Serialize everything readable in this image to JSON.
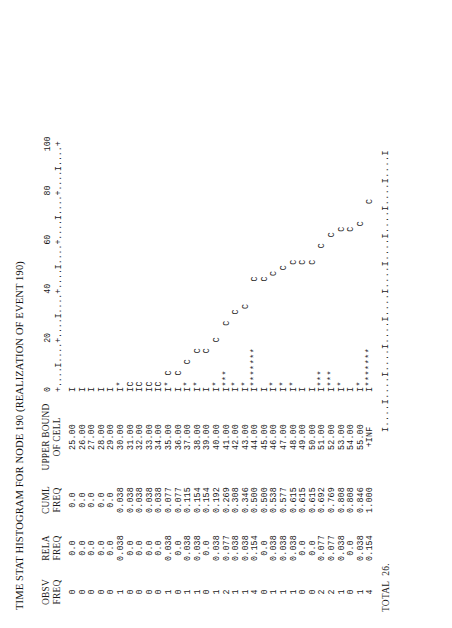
{
  "report": {
    "title": "TIME STAT HISTOGRAM FOR NODE 190 (REALIZATION OF EVENT 190)",
    "total_label": "TOTAL  26."
  },
  "columns": {
    "obsv": {
      "line1": "OBSV",
      "line2": "FREQ"
    },
    "rela": {
      "line1": "RELA",
      "line2": "FREQ"
    },
    "cuml": {
      "line1": "CUML",
      "line2": "FREQ"
    },
    "bound": {
      "line1": "UPPER BOUND",
      "line2": "OF CELL"
    }
  },
  "axis": {
    "tick_numbers": "0         20        40        60        80       100",
    "ruler": "+....I....+....I....+....I....+....I....+....I....+",
    "ruler_foot": "I....I....I....I....I....I....I....I....I....I....I",
    "labels": [
      "0",
      "20",
      "40",
      "60",
      "80",
      "100"
    ],
    "min": 0,
    "max": 100
  },
  "chart_data": {
    "type": "bar",
    "title": "TIME STAT HISTOGRAM FOR NODE 190 (REALIZATION OF EVENT 190)",
    "xlabel": "PERCENTAGE",
    "ylabel": "UPPER BOUND OF CELL",
    "xlim": [
      0,
      100
    ],
    "grid": false,
    "legend": [
      "* = relative frequency",
      "C = cumulative frequency"
    ],
    "total_observations": 26,
    "categories": [
      "25.00",
      "26.00",
      "27.00",
      "28.00",
      "29.00",
      "30.00",
      "31.00",
      "32.00",
      "33.00",
      "34.00",
      "35.00",
      "36.00",
      "37.00",
      "38.00",
      "39.00",
      "40.00",
      "41.00",
      "42.00",
      "43.00",
      "44.00",
      "45.00",
      "46.00",
      "47.00",
      "48.00",
      "49.00",
      "50.00",
      "51.00",
      "52.00",
      "53.00",
      "54.00",
      "55.00",
      "+INF"
    ],
    "series": [
      {
        "name": "OBSV FREQ",
        "values": [
          0,
          0,
          0,
          0,
          0,
          1,
          0,
          0,
          0,
          0,
          1,
          0,
          1,
          1,
          0,
          1,
          2,
          1,
          1,
          4,
          0,
          1,
          1,
          1,
          0,
          0,
          2,
          2,
          1,
          0,
          1,
          4
        ]
      },
      {
        "name": "RELA FREQ",
        "values": [
          0.0,
          0.0,
          0.0,
          0.0,
          0.0,
          0.038,
          0.0,
          0.0,
          0.0,
          0.0,
          0.038,
          0.0,
          0.038,
          0.038,
          0.0,
          0.038,
          0.077,
          0.038,
          0.038,
          0.154,
          0.0,
          0.038,
          0.038,
          0.038,
          0.0,
          0.0,
          0.077,
          0.077,
          0.038,
          0.0,
          0.038,
          0.154
        ]
      },
      {
        "name": "CUML FREQ",
        "values": [
          0.0,
          0.0,
          0.0,
          0.0,
          0.0,
          0.038,
          0.038,
          0.038,
          0.038,
          0.038,
          0.077,
          0.077,
          0.115,
          0.154,
          0.154,
          0.192,
          0.269,
          0.308,
          0.346,
          0.5,
          0.5,
          0.538,
          0.577,
          0.615,
          0.615,
          0.615,
          0.692,
          0.769,
          0.808,
          0.808,
          0.846,
          1.0
        ]
      }
    ]
  },
  "rows": [
    {
      "obsv": "0",
      "rela": "0.0",
      "cuml": "0.0",
      "bound": "25.00",
      "plot": "I"
    },
    {
      "obsv": "0",
      "rela": "0.0",
      "cuml": "0.0",
      "bound": "26.00",
      "plot": "I"
    },
    {
      "obsv": "0",
      "rela": "0.0",
      "cuml": "0.0",
      "bound": "27.00",
      "plot": "I"
    },
    {
      "obsv": "0",
      "rela": "0.0",
      "cuml": "0.0",
      "bound": "28.00",
      "plot": "I"
    },
    {
      "obsv": "0",
      "rela": "0.0",
      "cuml": "0.0",
      "bound": "29.00",
      "plot": "I"
    },
    {
      "obsv": "1",
      "rela": "0.038",
      "cuml": "0.038",
      "bound": "30.00",
      "plot": "I*"
    },
    {
      "obsv": "0",
      "rela": "0.0",
      "cuml": "0.038",
      "bound": "31.00",
      "plot": "IC"
    },
    {
      "obsv": "0",
      "rela": "0.0",
      "cuml": "0.038",
      "bound": "32.00",
      "plot": "IC"
    },
    {
      "obsv": "0",
      "rela": "0.0",
      "cuml": "0.038",
      "bound": "33.00",
      "plot": "IC"
    },
    {
      "obsv": "0",
      "rela": "0.0",
      "cuml": "0.038",
      "bound": "34.00",
      "plot": "IC"
    },
    {
      "obsv": "1",
      "rela": "0.038",
      "cuml": "0.077",
      "bound": "35.00",
      "plot": "I* C"
    },
    {
      "obsv": "0",
      "rela": "0.0",
      "cuml": "0.077",
      "bound": "36.00",
      "plot": "I  C"
    },
    {
      "obsv": "1",
      "rela": "0.038",
      "cuml": "0.115",
      "bound": "37.00",
      "plot": "I*   C"
    },
    {
      "obsv": "1",
      "rela": "0.038",
      "cuml": "0.154",
      "bound": "38.00",
      "plot": "I*     C"
    },
    {
      "obsv": "0",
      "rela": "0.0",
      "cuml": "0.154",
      "bound": "39.00",
      "plot": "I      C"
    },
    {
      "obsv": "1",
      "rela": "0.038",
      "cuml": "0.192",
      "bound": "40.00",
      "plot": "I*       C"
    },
    {
      "obsv": "2",
      "rela": "0.077",
      "cuml": "0.269",
      "bound": "41.00",
      "plot": "I***        C"
    },
    {
      "obsv": "1",
      "rela": "0.038",
      "cuml": "0.308",
      "bound": "42.00",
      "plot": "I*            C"
    },
    {
      "obsv": "1",
      "rela": "0.038",
      "cuml": "0.346",
      "bound": "43.00",
      "plot": "I*             C"
    },
    {
      "obsv": "4",
      "rela": "0.154",
      "cuml": "0.500",
      "bound": "44.00",
      "plot": "I*******            C"
    },
    {
      "obsv": "0",
      "rela": "0.0",
      "cuml": "0.500",
      "bound": "45.00",
      "plot": "I                   C"
    },
    {
      "obsv": "1",
      "rela": "0.038",
      "cuml": "0.538",
      "bound": "46.00",
      "plot": "I*                   C"
    },
    {
      "obsv": "1",
      "rela": "0.038",
      "cuml": "0.577",
      "bound": "47.00",
      "plot": "I*                    C"
    },
    {
      "obsv": "1",
      "rela": "0.038",
      "cuml": "0.615",
      "bound": "48.00",
      "plot": "I*                     C"
    },
    {
      "obsv": "0",
      "rela": "0.0",
      "cuml": "0.615",
      "bound": "49.00",
      "plot": "I                      C"
    },
    {
      "obsv": "0",
      "rela": "0.0",
      "cuml": "0.615",
      "bound": "50.00",
      "plot": "I                      C"
    },
    {
      "obsv": "2",
      "rela": "0.077",
      "cuml": "0.692",
      "bound": "51.00",
      "plot": "I***                      C"
    },
    {
      "obsv": "2",
      "rela": "0.077",
      "cuml": "0.769",
      "bound": "52.00",
      "plot": "I***                        C"
    },
    {
      "obsv": "1",
      "rela": "0.038",
      "cuml": "0.808",
      "bound": "53.00",
      "plot": "I*                           C"
    },
    {
      "obsv": "0",
      "rela": "0.0",
      "cuml": "0.808",
      "bound": "54.00",
      "plot": "I                            C"
    },
    {
      "obsv": "1",
      "rela": "0.038",
      "cuml": "0.846",
      "bound": "55.00",
      "plot": "I*                            C"
    },
    {
      "obsv": "4",
      "rela": "0.154",
      "cuml": "1.000",
      "bound": "+INF",
      "plot": "I*******                          C"
    }
  ]
}
